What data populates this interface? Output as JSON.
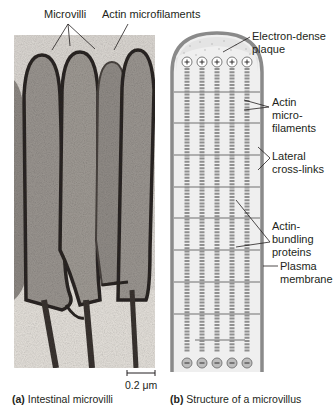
{
  "panel_a": {
    "labels": {
      "microvilli": "Microvilli",
      "actin_microfilaments": "Actin microfilaments"
    },
    "scale_bar": "0.2 μm",
    "caption_letter": "(a)",
    "caption_text": " Intestinal microvilli"
  },
  "panel_b": {
    "labels": {
      "plaque_1": "Electron-dense",
      "plaque_2": "plaque",
      "actin_1": "Actin",
      "actin_2": "micro-",
      "actin_3": "filaments",
      "crosslinks_1": "Lateral",
      "crosslinks_2": "cross-links",
      "bundling_1": "Actin-",
      "bundling_2": "bundling",
      "bundling_3": "proteins",
      "membrane_1": "Plasma",
      "membrane_2": "membrane"
    },
    "top_end_symbol": "+",
    "bottom_end_symbol": "−",
    "filament_count": 5,
    "caption_letter": "(b)",
    "caption_text": " Structure of a microvillus"
  },
  "colors": {
    "membrane": "#8a8a8a",
    "interior": "#efefef",
    "filament": "#9a9a9a",
    "micrograph_bg": "#d8d4cf",
    "micrograph_dark": "#2b2623"
  }
}
